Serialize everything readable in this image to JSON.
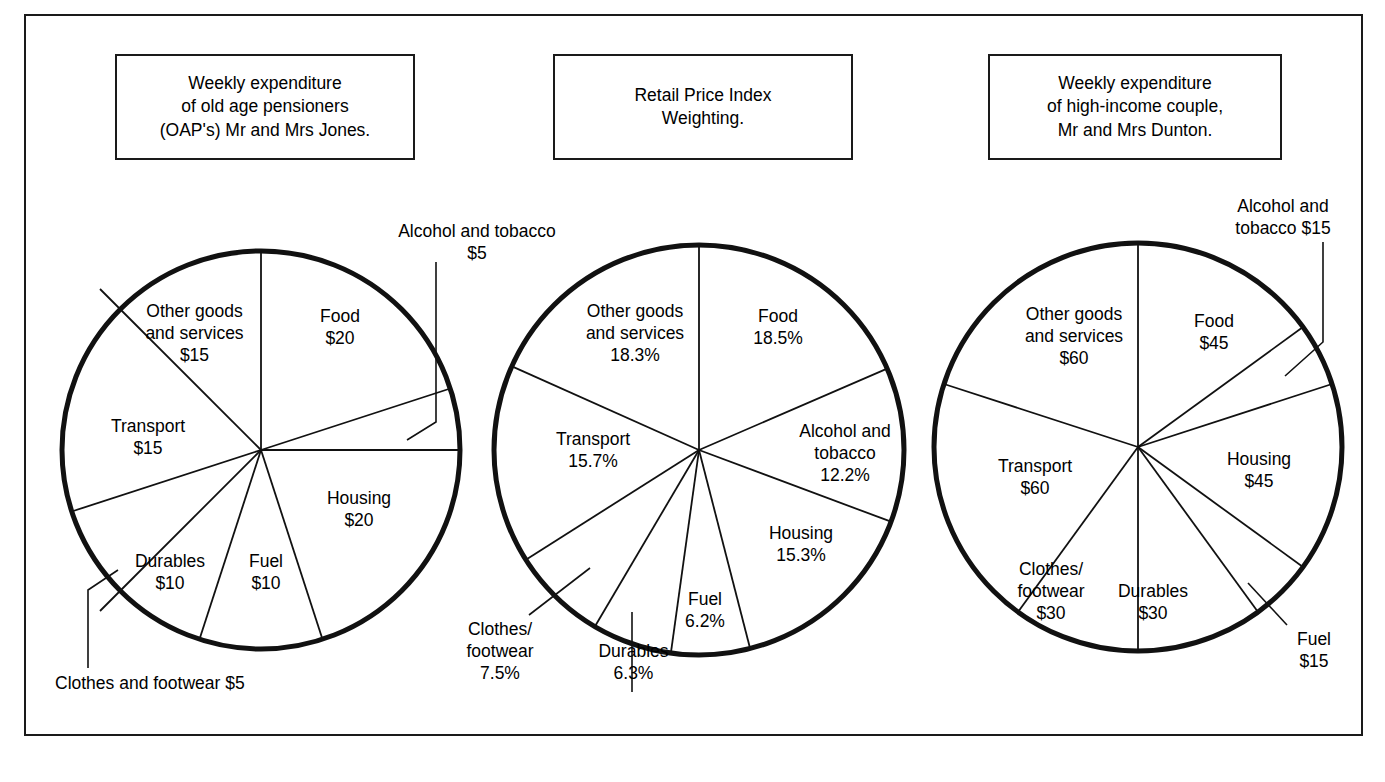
{
  "figure": {
    "background": "#ffffff",
    "stroke": "#1a1a1a",
    "border_present": true
  },
  "panels": [
    {
      "id": "oap",
      "title": "Weekly expenditure\nof old age pensioners\n(OAP's) Mr and Mrs Jones.",
      "title_box": {
        "x": 115,
        "y": 54,
        "w": 300,
        "h": 106
      },
      "pie": {
        "cx": 261,
        "cy": 450,
        "r": 199
      },
      "unit": "$",
      "labels": {
        "food": "Food\n$20",
        "alcohol": "Alcohol and tobacco\n$5",
        "housing": "Housing\n$20",
        "fuel": "Fuel\n$10",
        "durables": "Durables\n$10",
        "clothes": "Clothes and footwear $5",
        "transport": "Transport\n$15",
        "other": "Other goods\nand services\n$15"
      }
    },
    {
      "id": "rpi",
      "title": "Retail Price Index\nWeighting.",
      "title_box": {
        "x": 553,
        "y": 54,
        "w": 300,
        "h": 106
      },
      "pie": {
        "cx": 699,
        "cy": 450,
        "r": 205
      },
      "unit": "%",
      "labels": {
        "food": "Food\n18.5%",
        "alcohol": "Alcohol and\ntobacco\n12.2%",
        "housing": "Housing\n15.3%",
        "fuel": "Fuel\n6.2%",
        "durables": "Durables\n6.3%",
        "clothes": "Clothes/\nfootwear\n7.5%",
        "transport": "Transport\n15.7%",
        "other": "Other goods\nand services\n18.3%"
      }
    },
    {
      "id": "dunton",
      "title": "Weekly expenditure\nof high-income couple,\nMr and Mrs Dunton.",
      "title_box": {
        "x": 988,
        "y": 54,
        "w": 294,
        "h": 106
      },
      "pie": {
        "cx": 1138,
        "cy": 447,
        "r": 204
      },
      "unit": "$",
      "labels": {
        "food": "Food\n$45",
        "alcohol": "Alcohol and\ntobacco $15",
        "housing": "Housing\n$45",
        "fuel": "Fuel\n$15",
        "durables": "Durables\n$30",
        "clothes": "Clothes/\nfootwear\n$30",
        "transport": "Transport\n$60",
        "other": "Other goods\nand services\n$60"
      }
    }
  ],
  "chart_data": [
    {
      "type": "pie",
      "title": "Weekly expenditure of old age pensioners (OAP's) Mr and Mrs Jones.",
      "unit": "$",
      "total": 100,
      "start_angle_deg": 0,
      "direction": "clockwise",
      "categories": [
        "Food",
        "Alcohol and tobacco",
        "Housing",
        "Fuel",
        "Durables",
        "Clothes and footwear",
        "Transport",
        "Other goods and services"
      ],
      "values": [
        20,
        5,
        20,
        10,
        10,
        5,
        15,
        15
      ],
      "value_labels": [
        "$20",
        "$5",
        "$20",
        "$10",
        "$10",
        "$5",
        "$15",
        "$15"
      ],
      "leader_line_slices": [
        "Alcohol and tobacco",
        "Clothes and footwear"
      ]
    },
    {
      "type": "pie",
      "title": "Retail Price Index Weighting.",
      "unit": "%",
      "total": 100,
      "start_angle_deg": 0,
      "direction": "clockwise",
      "categories": [
        "Food",
        "Alcohol and tobacco",
        "Housing",
        "Fuel",
        "Durables",
        "Clothes/footwear",
        "Transport",
        "Other goods and services"
      ],
      "values": [
        18.5,
        12.2,
        15.3,
        6.2,
        6.3,
        7.5,
        15.7,
        18.3
      ],
      "value_labels": [
        "18.5%",
        "12.2%",
        "15.3%",
        "6.2%",
        "6.3%",
        "7.5%",
        "15.7%",
        "18.3%"
      ],
      "leader_line_slices": [
        "Clothes/footwear",
        "Durables"
      ]
    },
    {
      "type": "pie",
      "title": "Weekly expenditure of high-income couple, Mr and Mrs Dunton.",
      "unit": "$",
      "total": 300,
      "start_angle_deg": 0,
      "direction": "clockwise",
      "categories": [
        "Food",
        "Alcohol and tobacco",
        "Housing",
        "Fuel",
        "Durables",
        "Clothes/footwear",
        "Transport",
        "Other goods and services"
      ],
      "values": [
        45,
        15,
        45,
        15,
        30,
        30,
        60,
        60
      ],
      "value_labels": [
        "$45",
        "$15",
        "$45",
        "$15",
        "$30",
        "$30",
        "$60",
        "$60"
      ],
      "leader_line_slices": [
        "Alcohol and tobacco",
        "Fuel"
      ]
    }
  ]
}
